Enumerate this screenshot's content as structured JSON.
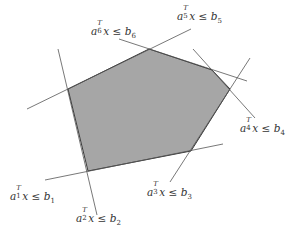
{
  "diagram": {
    "colors": {
      "fill": "#a6a6a6",
      "edge": "#3a3a3a",
      "line": "#555555",
      "background": "#ffffff",
      "text": "#333333"
    },
    "polygon": {
      "vertices": [
        [
          68,
          89
        ],
        [
          149,
          49
        ],
        [
          212,
          70
        ],
        [
          230,
          89
        ],
        [
          191,
          151
        ],
        [
          88,
          171
        ]
      ]
    },
    "lines": [
      {
        "id": "1",
        "from": [
          45,
          180
        ],
        "to": [
          223,
          144
        ]
      },
      {
        "id": "2",
        "from": [
          58,
          49
        ],
        "to": [
          97,
          215
        ]
      },
      {
        "id": "3",
        "from": [
          170,
          182
        ],
        "to": [
          250,
          58
        ]
      },
      {
        "id": "4",
        "from": [
          193,
          49
        ],
        "to": [
          255,
          118
        ]
      },
      {
        "id": "5",
        "from": [
          27,
          109
        ],
        "to": [
          191,
          29
        ]
      },
      {
        "id": "6",
        "from": [
          119,
          39
        ],
        "to": [
          247,
          81
        ]
      }
    ],
    "labels": [
      {
        "id": "1",
        "a": "a",
        "sup": "T",
        "sub": "1",
        "x": "x",
        "rel": "≤",
        "b": "b",
        "bsub": "1",
        "pos": [
          10,
          190
        ]
      },
      {
        "id": "2",
        "a": "a",
        "sup": "T",
        "sub": "2",
        "x": "x",
        "rel": "≤",
        "b": "b",
        "bsub": "2",
        "pos": [
          76,
          212
        ]
      },
      {
        "id": "3",
        "a": "a",
        "sup": "T",
        "sub": "3",
        "x": "x",
        "rel": "≤",
        "b": "b",
        "bsub": "3",
        "pos": [
          147,
          186
        ]
      },
      {
        "id": "4",
        "a": "a",
        "sup": "T",
        "sub": "4",
        "x": "x",
        "rel": "≤",
        "b": "b",
        "bsub": "4",
        "pos": [
          240,
          122
        ]
      },
      {
        "id": "5",
        "a": "a",
        "sup": "T",
        "sub": "5",
        "x": "x",
        "rel": "≤",
        "b": "b",
        "bsub": "5",
        "pos": [
          177,
          10
        ]
      },
      {
        "id": "6",
        "a": "a",
        "sup": "T",
        "sub": "6",
        "x": "x",
        "rel": "≤",
        "b": "b",
        "bsub": "6",
        "pos": [
          91,
          25
        ]
      }
    ]
  }
}
